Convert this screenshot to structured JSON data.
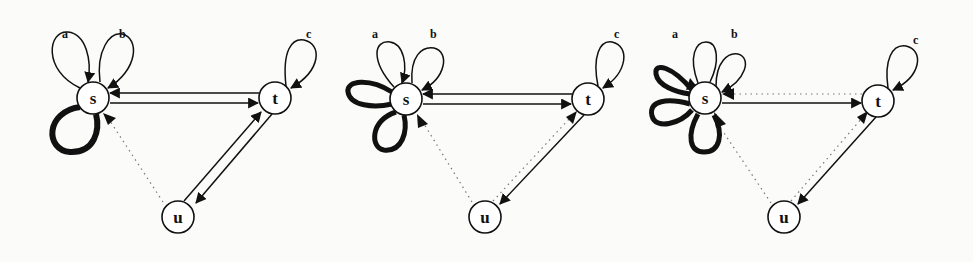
{
  "figure": {
    "panels": [
      {
        "id": "panel-1",
        "nodes": [
          {
            "id": "s",
            "label": "s",
            "x": 93,
            "y": 98
          },
          {
            "id": "t",
            "label": "t",
            "x": 275,
            "y": 98
          },
          {
            "id": "u",
            "label": "u",
            "x": 178,
            "y": 217
          }
        ],
        "self_loops": [
          {
            "node": "s",
            "label": "a",
            "style": "thin"
          },
          {
            "node": "s",
            "label": "b",
            "style": "thin"
          },
          {
            "node": "s",
            "label": "",
            "style": "thick"
          },
          {
            "node": "t",
            "label": "c",
            "style": "thin"
          }
        ],
        "edges": [
          {
            "from": "t",
            "to": "s",
            "style": "solid"
          },
          {
            "from": "s",
            "to": "t",
            "style": "solid"
          },
          {
            "from": "u",
            "to": "t",
            "style": "solid"
          },
          {
            "from": "t",
            "to": "u",
            "style": "solid"
          },
          {
            "from": "u",
            "to": "s",
            "style": "dotted"
          }
        ]
      },
      {
        "id": "panel-2",
        "nodes": [
          {
            "id": "s",
            "label": "s",
            "x": 406,
            "y": 99
          },
          {
            "id": "t",
            "label": "t",
            "x": 588,
            "y": 99
          },
          {
            "id": "u",
            "label": "u",
            "x": 485,
            "y": 217
          }
        ],
        "self_loops": [
          {
            "node": "s",
            "label": "a",
            "style": "thin"
          },
          {
            "node": "s",
            "label": "b",
            "style": "thin"
          },
          {
            "node": "s",
            "label": "",
            "style": "thick"
          },
          {
            "node": "s",
            "label": "",
            "style": "thick"
          },
          {
            "node": "t",
            "label": "c",
            "style": "thin"
          }
        ],
        "edges": [
          {
            "from": "t",
            "to": "s",
            "style": "solid"
          },
          {
            "from": "s",
            "to": "t",
            "style": "solid"
          },
          {
            "from": "t",
            "to": "u",
            "style": "solid"
          },
          {
            "from": "u",
            "to": "t",
            "style": "dotted"
          },
          {
            "from": "u",
            "to": "s",
            "style": "dotted"
          }
        ]
      },
      {
        "id": "panel-3",
        "nodes": [
          {
            "id": "s",
            "label": "s",
            "x": 705,
            "y": 98
          },
          {
            "id": "t",
            "label": "t",
            "x": 878,
            "y": 101
          },
          {
            "id": "u",
            "label": "u",
            "x": 784,
            "y": 217
          }
        ],
        "self_loops": [
          {
            "node": "s",
            "label": "a",
            "style": "thin"
          },
          {
            "node": "s",
            "label": "b",
            "style": "thin"
          },
          {
            "node": "s",
            "label": "",
            "style": "thick"
          },
          {
            "node": "s",
            "label": "",
            "style": "thick"
          },
          {
            "node": "s",
            "label": "",
            "style": "thick"
          },
          {
            "node": "t",
            "label": "c",
            "style": "thin"
          }
        ],
        "edges": [
          {
            "from": "t",
            "to": "s",
            "style": "dotted"
          },
          {
            "from": "s",
            "to": "t",
            "style": "solid"
          },
          {
            "from": "t",
            "to": "u",
            "style": "solid"
          },
          {
            "from": "u",
            "to": "t",
            "style": "dotted"
          },
          {
            "from": "u",
            "to": "s",
            "style": "dotted"
          }
        ]
      }
    ],
    "labels": {
      "p1": {
        "s": "s",
        "t": "t",
        "u": "u",
        "a": "a",
        "b": "b",
        "c": "c"
      },
      "p2": {
        "s": "s",
        "t": "t",
        "u": "u",
        "a": "a",
        "b": "b",
        "c": "c"
      },
      "p3": {
        "s": "s",
        "t": "t",
        "u": "u",
        "a": "a",
        "b": "b",
        "c": "c"
      }
    },
    "colors": {
      "ink": "#111111",
      "dotted": "#777777",
      "background": "#fbfbfa"
    }
  }
}
